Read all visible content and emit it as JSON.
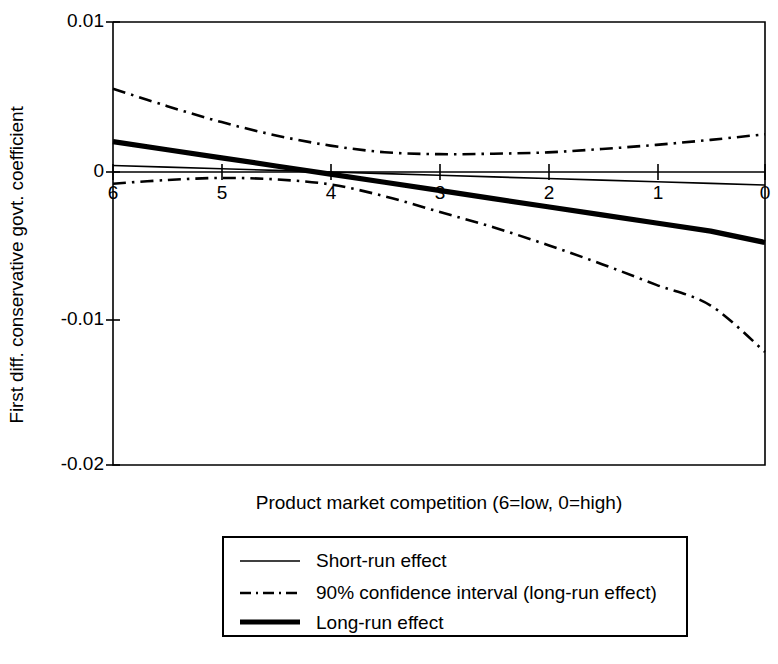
{
  "chart_data": {
    "type": "line",
    "title": "",
    "xlabel": "Product market competition (6=low, 0=high)",
    "ylabel": "First diff. conservative govt. coefficient",
    "xlim": [
      6,
      0
    ],
    "ylim": [
      -0.02,
      0.01
    ],
    "x_reversed": true,
    "grid": false,
    "zero_line": true,
    "legend_position": "below-plot",
    "xticks": [
      "6",
      "5",
      "4",
      "3",
      "2",
      "1",
      "0"
    ],
    "xtick_values": [
      6,
      5,
      4,
      3,
      2,
      1,
      0
    ],
    "yticks": [
      "0.01",
      "0",
      "-0.01",
      "-0.02"
    ],
    "ytick_values": [
      0.01,
      0,
      -0.01,
      -0.02
    ],
    "x": [
      6,
      5.5,
      5,
      4.5,
      4,
      3.5,
      3,
      2.5,
      2,
      1.5,
      1,
      0.5,
      0
    ],
    "series": [
      {
        "name": "Short-run effect",
        "style": "thin-solid",
        "values": [
          0.00028,
          0.00017,
          6e-05,
          -5e-05,
          -0.00016,
          -0.00027,
          -0.00038,
          -0.00049,
          -0.0006,
          -0.00071,
          -0.00082,
          -0.00093,
          -0.00104
        ]
      },
      {
        "name": "90% confidence interval (long-run effect)",
        "style": "dash-dot",
        "bound": "upper",
        "values": [
          0.00548,
          0.0043,
          0.00322,
          0.00232,
          0.00163,
          0.00118,
          0.00105,
          0.00108,
          0.00117,
          0.0014,
          0.00168,
          0.00202,
          0.0024
        ]
      },
      {
        "name": "90% confidence interval (long-run effect)",
        "style": "dash-dot",
        "bound": "lower",
        "values": [
          -0.00095,
          -0.0007,
          -0.00056,
          -0.00066,
          -0.001,
          -0.0018,
          -0.00285,
          -0.0039,
          -0.0051,
          -0.0064,
          -0.0078,
          -0.0092,
          -0.01235
        ]
      },
      {
        "name": "Long-run effect",
        "style": "thick-solid",
        "values": [
          0.0019,
          0.00135,
          0.0008,
          0.00025,
          -0.0003,
          -0.00085,
          -0.0014,
          -0.00196,
          -0.00251,
          -0.00306,
          -0.00361,
          -0.00416,
          -0.00493
        ]
      }
    ],
    "legend": [
      {
        "label": "Short-run effect",
        "style": "thin-solid"
      },
      {
        "label": "90% confidence interval (long-run effect)",
        "style": "dash-dot"
      },
      {
        "label": "Long-run effect",
        "style": "thick-solid"
      }
    ]
  },
  "axes": {
    "y_title": "First diff. conservative govt. coefficient",
    "x_title": "Product market competition (6=low, 0=high)",
    "y_tick_labels": [
      "0.01",
      "0",
      "-0.01",
      "-0.02"
    ],
    "x_tick_labels": [
      "6",
      "5",
      "4",
      "3",
      "2",
      "1",
      "0"
    ]
  },
  "legend": {
    "items": [
      {
        "label": "Short-run effect"
      },
      {
        "label": "90% confidence interval (long-run effect)"
      },
      {
        "label": "Long-run effect"
      }
    ]
  },
  "colors": {
    "line": "#000000",
    "background": "#ffffff",
    "axis": "#000000"
  }
}
